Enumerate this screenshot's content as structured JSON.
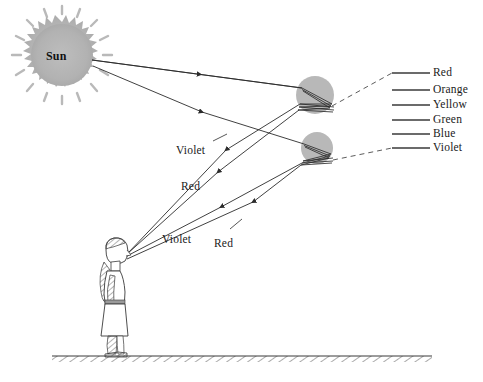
{
  "figure": {
    "background_color": "#ffffff",
    "ink_color": "#2b2b2b",
    "drop_fill": "#b8b8b8",
    "sun_fill": "#b5b5b5"
  },
  "sun": {
    "label": "Sun",
    "center_x": 62,
    "center_y": 55,
    "radius": 32
  },
  "raindrops": [
    {
      "name": "upper-raindrop",
      "center_x": 315,
      "center_y": 95,
      "radius": 19
    },
    {
      "name": "lower-raindrop",
      "center_x": 317,
      "center_y": 148,
      "radius": 16
    }
  ],
  "ray_labels": [
    {
      "id": "violet-upper",
      "text": "Violet",
      "x": 176,
      "y": 144
    },
    {
      "id": "red-middle",
      "text": "Red",
      "x": 181,
      "y": 180
    },
    {
      "id": "violet-lower",
      "text": "Violet",
      "x": 162,
      "y": 233
    },
    {
      "id": "red-lower",
      "text": "Red",
      "x": 214,
      "y": 237
    }
  ],
  "spectrum": {
    "line_start_x": 392,
    "line_end_x": 430,
    "label_x": 433,
    "entries": [
      {
        "name": "Red",
        "y": 73,
        "color": "#3a3a3a"
      },
      {
        "name": "Orange",
        "y": 90,
        "color": "#3a3a3a"
      },
      {
        "name": "Yellow",
        "y": 105,
        "color": "#3a3a3a"
      },
      {
        "name": "Green",
        "y": 120,
        "color": "#3a3a3a"
      },
      {
        "name": "Blue",
        "y": 134,
        "color": "#3a3a3a"
      },
      {
        "name": "Violet",
        "y": 148,
        "color": "#3a3a3a"
      }
    ]
  },
  "observer": {
    "name": "person-observer",
    "eye_x": 124,
    "eye_y": 256,
    "ground_y": 356
  },
  "ground": {
    "x_start": 52,
    "x_end": 432,
    "y": 356
  }
}
